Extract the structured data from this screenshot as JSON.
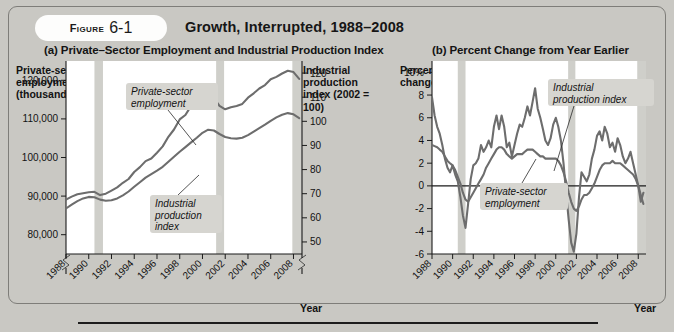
{
  "figure": {
    "label_word": "Figure",
    "number": "6-1",
    "title": "Growth, Interrupted, 1988–2008"
  },
  "panel_a": {
    "subtitle": "(a) Private–Sector Employment and Industrial Production Index",
    "y_left_title": "Private-sector employment (thousands)",
    "y_right_title": "Industrial production index (2002 = 100)",
    "x_title": "Year",
    "callout_employment": "Private-sector employment",
    "callout_ip": "Industrial production index"
  },
  "panel_b": {
    "subtitle": "(b) Percent Change from Year Earlier",
    "y_title": "Percent change",
    "x_title": "Year",
    "callout_ip": "Industrial production index",
    "callout_employment": "Private-sector employment"
  },
  "colors": {
    "page_background": "#c9c8c3",
    "plot_background": "#ffffff",
    "series_line": "#6d6d6d",
    "recession_band": "#cfcfca",
    "text": "#121212",
    "pill_background": "#fdfdfc"
  },
  "chart_data": [
    {
      "type": "line",
      "title": "(a) Private-Sector Employment and Industrial Production Index",
      "xlabel": "Year",
      "ylabel": "Private-sector employment (thousands)",
      "y2label": "Industrial production index (2002 = 100)",
      "xlim": [
        1988,
        2008.75
      ],
      "ylim": [
        75000,
        125000
      ],
      "y2lim": [
        45,
        125
      ],
      "xticks": [
        1988,
        1990,
        1992,
        1994,
        1996,
        1998,
        2000,
        2002,
        2004,
        2006,
        2008
      ],
      "xticklabels": [
        "1988",
        "1990",
        "1992",
        "1994",
        "1996",
        "1998",
        "2000",
        "2002",
        "2004",
        "2006",
        "2008"
      ],
      "yticks": [
        80000,
        90000,
        100000,
        110000,
        120000
      ],
      "yticklabels": [
        "80,000",
        "90,000",
        "100,000",
        "110,000",
        "120,000"
      ],
      "y2ticks": [
        50,
        60,
        70,
        80,
        90,
        100,
        110,
        120
      ],
      "y2ticklabels": [
        "50",
        "60",
        "70",
        "80",
        "90",
        "100",
        "110",
        "120"
      ],
      "axis_break_left": true,
      "grid": false,
      "recessions": [
        [
          1990.5,
          1991.25
        ],
        [
          2001.2,
          2001.9
        ],
        [
          2007.9,
          2008.75
        ]
      ],
      "series": [
        {
          "name": "Private-sector employment",
          "axis": "left",
          "x": [
            1988.0,
            1988.5,
            1989.0,
            1989.5,
            1990.0,
            1990.5,
            1991.0,
            1991.5,
            1992.0,
            1992.5,
            1993.0,
            1993.5,
            1994.0,
            1994.5,
            1995.0,
            1995.5,
            1996.0,
            1996.5,
            1997.0,
            1997.5,
            1998.0,
            1998.5,
            1999.0,
            1999.5,
            2000.0,
            2000.5,
            2001.0,
            2001.5,
            2002.0,
            2002.5,
            2003.0,
            2003.5,
            2004.0,
            2004.5,
            2005.0,
            2005.5,
            2006.0,
            2006.5,
            2007.0,
            2007.5,
            2008.0,
            2008.5
          ],
          "y": [
            86800,
            87800,
            88700,
            89400,
            89800,
            89700,
            89100,
            88800,
            88900,
            89400,
            90200,
            91200,
            92400,
            93600,
            94800,
            95700,
            96600,
            97600,
            98900,
            100200,
            101500,
            102700,
            103900,
            105100,
            106400,
            107200,
            107000,
            106100,
            105300,
            105000,
            104900,
            105100,
            105800,
            106700,
            107600,
            108500,
            109500,
            110400,
            111100,
            111500,
            111200,
            110200
          ]
        },
        {
          "name": "Industrial production index",
          "axis": "right",
          "x": [
            1988.0,
            1988.5,
            1989.0,
            1989.5,
            1990.0,
            1990.5,
            1991.0,
            1991.5,
            1992.0,
            1992.5,
            1993.0,
            1993.5,
            1994.0,
            1994.5,
            1995.0,
            1995.5,
            1996.0,
            1996.5,
            1997.0,
            1997.5,
            1998.0,
            1998.5,
            1999.0,
            1999.5,
            2000.0,
            2000.5,
            2001.0,
            2001.5,
            2002.0,
            2002.5,
            2003.0,
            2003.5,
            2004.0,
            2004.5,
            2005.0,
            2005.5,
            2006.0,
            2006.5,
            2007.0,
            2007.5,
            2008.0,
            2008.5
          ],
          "y": [
            67.5,
            68.8,
            69.8,
            70.2,
            70.6,
            70.8,
            69.4,
            70.0,
            71.3,
            72.6,
            74.5,
            76.1,
            79.0,
            81.0,
            83.5,
            84.6,
            87.0,
            89.6,
            93.6,
            96.6,
            100.8,
            102.6,
            106.4,
            109.0,
            112.0,
            112.8,
            109.6,
            106.4,
            105.0,
            105.8,
            106.4,
            107.2,
            109.8,
            111.6,
            113.6,
            115.0,
            117.4,
            118.4,
            119.8,
            121.0,
            120.4,
            117.6
          ]
        }
      ]
    },
    {
      "type": "line",
      "title": "(b) Percent Change from Year Earlier",
      "xlabel": "Year",
      "ylabel": "Percent change",
      "xlim": [
        1988,
        2008.75
      ],
      "ylim": [
        -6,
        11
      ],
      "xticks": [
        1988,
        1990,
        1992,
        1994,
        1996,
        1998,
        2000,
        2002,
        2004,
        2006,
        2008
      ],
      "xticklabels": [
        "1988",
        "1990",
        "1992",
        "1994",
        "1996",
        "1998",
        "2000",
        "2002",
        "2004",
        "2006",
        "2008"
      ],
      "yticks": [
        -6,
        -4,
        -2,
        0,
        2,
        4,
        6,
        8,
        10
      ],
      "yticklabels": [
        "-6",
        "-4",
        "-2",
        "0",
        "2",
        "4",
        "6",
        "8",
        "10%"
      ],
      "zero_line": true,
      "grid": false,
      "recessions": [
        [
          1990.5,
          1991.25
        ],
        [
          2001.2,
          2001.9
        ],
        [
          2007.9,
          2008.75
        ]
      ],
      "series": [
        {
          "name": "Industrial production index",
          "x": [
            1988.0,
            1988.25,
            1988.5,
            1988.75,
            1989.0,
            1989.25,
            1989.5,
            1989.75,
            1990.0,
            1990.25,
            1990.5,
            1990.75,
            1991.0,
            1991.25,
            1991.5,
            1991.75,
            1992.0,
            1992.25,
            1992.5,
            1992.75,
            1993.0,
            1993.25,
            1993.5,
            1993.75,
            1994.0,
            1994.25,
            1994.5,
            1994.75,
            1995.0,
            1995.25,
            1995.5,
            1995.75,
            1996.0,
            1996.25,
            1996.5,
            1996.75,
            1997.0,
            1997.25,
            1997.5,
            1997.75,
            1998.0,
            1998.25,
            1998.5,
            1998.75,
            1999.0,
            1999.25,
            1999.5,
            1999.75,
            2000.0,
            2000.25,
            2000.5,
            2000.75,
            2001.0,
            2001.25,
            2001.5,
            2001.75,
            2002.0,
            2002.25,
            2002.5,
            2002.75,
            2003.0,
            2003.25,
            2003.5,
            2003.75,
            2004.0,
            2004.25,
            2004.5,
            2004.75,
            2005.0,
            2005.25,
            2005.5,
            2005.75,
            2006.0,
            2006.25,
            2006.5,
            2006.75,
            2007.0,
            2007.25,
            2007.5,
            2007.75,
            2008.0,
            2008.25,
            2008.5
          ],
          "y": [
            7.8,
            6.2,
            5.2,
            4.6,
            3.6,
            2.4,
            1.6,
            1.2,
            1.8,
            1.0,
            0.4,
            -1.0,
            -2.6,
            -3.7,
            -1.6,
            0.6,
            1.8,
            2.0,
            2.4,
            3.6,
            3.0,
            3.4,
            4.0,
            3.4,
            5.2,
            6.2,
            5.0,
            6.2,
            5.2,
            3.4,
            3.8,
            2.6,
            3.6,
            4.6,
            5.4,
            5.2,
            6.0,
            7.0,
            6.2,
            7.4,
            8.6,
            6.8,
            6.0,
            5.0,
            4.0,
            3.6,
            4.2,
            5.4,
            6.0,
            5.2,
            4.0,
            2.0,
            -0.6,
            -3.0,
            -5.0,
            -5.8,
            -4.2,
            -1.0,
            1.2,
            0.8,
            0.4,
            1.0,
            2.4,
            3.2,
            4.4,
            4.8,
            4.0,
            5.2,
            4.6,
            3.4,
            3.8,
            3.0,
            4.2,
            3.6,
            2.6,
            2.0,
            2.4,
            3.0,
            2.0,
            1.0,
            0.0,
            -1.4,
            -0.6
          ]
        },
        {
          "name": "Private-sector employment",
          "x": [
            1988.0,
            1988.25,
            1988.5,
            1988.75,
            1989.0,
            1989.25,
            1989.5,
            1989.75,
            1990.0,
            1990.25,
            1990.5,
            1990.75,
            1991.0,
            1991.25,
            1991.5,
            1991.75,
            1992.0,
            1992.25,
            1992.5,
            1992.75,
            1993.0,
            1993.25,
            1993.5,
            1993.75,
            1994.0,
            1994.25,
            1994.5,
            1994.75,
            1995.0,
            1995.25,
            1995.5,
            1995.75,
            1996.0,
            1996.25,
            1996.5,
            1996.75,
            1997.0,
            1997.25,
            1997.5,
            1997.75,
            1998.0,
            1998.25,
            1998.5,
            1998.75,
            1999.0,
            1999.25,
            1999.5,
            1999.75,
            2000.0,
            2000.25,
            2000.5,
            2000.75,
            2001.0,
            2001.25,
            2001.5,
            2001.75,
            2002.0,
            2002.25,
            2002.5,
            2002.75,
            2003.0,
            2003.25,
            2003.5,
            2003.75,
            2004.0,
            2004.25,
            2004.5,
            2004.75,
            2005.0,
            2005.25,
            2005.5,
            2005.75,
            2006.0,
            2006.25,
            2006.5,
            2006.75,
            2007.0,
            2007.25,
            2007.5,
            2007.75,
            2008.0,
            2008.25,
            2008.5
          ],
          "y": [
            3.6,
            3.5,
            3.4,
            3.2,
            3.0,
            2.6,
            2.2,
            2.0,
            1.8,
            1.4,
            0.8,
            0.2,
            -0.6,
            -1.2,
            -1.4,
            -1.0,
            -0.6,
            -0.2,
            0.2,
            0.6,
            1.0,
            1.6,
            2.0,
            2.4,
            2.8,
            3.2,
            3.4,
            3.4,
            3.2,
            2.8,
            2.6,
            2.4,
            2.6,
            2.8,
            2.8,
            2.8,
            3.0,
            3.2,
            3.2,
            3.2,
            3.0,
            2.8,
            2.6,
            2.6,
            2.4,
            2.4,
            2.4,
            2.4,
            2.4,
            2.2,
            1.8,
            1.2,
            0.4,
            -0.6,
            -1.4,
            -2.0,
            -2.2,
            -1.8,
            -1.2,
            -0.8,
            -0.8,
            -0.6,
            -0.2,
            0.2,
            0.8,
            1.4,
            1.8,
            2.0,
            2.0,
            2.0,
            2.2,
            2.0,
            2.0,
            2.0,
            1.8,
            1.6,
            1.4,
            1.2,
            1.0,
            0.6,
            0.0,
            -0.8,
            -1.6
          ]
        }
      ]
    }
  ]
}
